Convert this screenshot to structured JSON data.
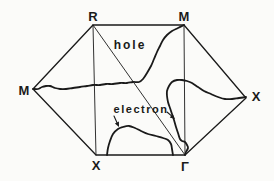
{
  "figure": {
    "background_color": "#fbfbf9",
    "ink_color": "#1a1a1a"
  },
  "zone": {
    "boundary_points": [
      [
        33,
        89
      ],
      [
        93,
        25
      ],
      [
        184,
        25
      ],
      [
        246,
        98
      ],
      [
        185,
        155
      ],
      [
        96,
        155
      ]
    ],
    "internal_lines": [
      {
        "name": "line-R-X",
        "from": [
          93,
          25
        ],
        "to": [
          96,
          155
        ]
      },
      {
        "name": "line-M-Gamma",
        "from": [
          184,
          25
        ],
        "to": [
          185,
          155
        ]
      },
      {
        "name": "line-R-Gamma",
        "from": [
          93,
          25
        ],
        "to": [
          185,
          155
        ]
      }
    ]
  },
  "point_labels": [
    {
      "id": "label-R-top",
      "text": "R",
      "x": 93,
      "y": 21
    },
    {
      "id": "label-M-top-right",
      "text": "M",
      "x": 184,
      "y": 21
    },
    {
      "id": "label-M-left",
      "text": "M",
      "x": 24,
      "y": 95
    },
    {
      "id": "label-X-right",
      "text": "X",
      "x": 256,
      "y": 101
    },
    {
      "id": "label-X-bottom",
      "text": "X",
      "x": 96,
      "y": 170
    },
    {
      "id": "label-Gamma-bottom",
      "text": "Γ",
      "x": 185,
      "y": 171
    }
  ],
  "region_labels": [
    {
      "id": "label-hole",
      "text": "hole",
      "x": 130,
      "y": 49,
      "font_size": 12,
      "letter_spacing": 2
    },
    {
      "id": "label-electron",
      "text": "electron",
      "x": 141,
      "y": 113,
      "font_size": 11,
      "letter_spacing": 1.5
    }
  ],
  "fermi_curves": [
    {
      "name": "hole-surface-curve",
      "points": [
        [
          184,
          25
        ],
        [
          178,
          28
        ],
        [
          172,
          31
        ],
        [
          167,
          35
        ],
        [
          163,
          40
        ],
        [
          160,
          46
        ],
        [
          157,
          52
        ],
        [
          154,
          59
        ],
        [
          151,
          66
        ],
        [
          147,
          73
        ],
        [
          143,
          79
        ],
        [
          139,
          82
        ],
        [
          133,
          82
        ],
        [
          127,
          83
        ],
        [
          120,
          83
        ],
        [
          113,
          84
        ],
        [
          106,
          84
        ],
        [
          100,
          85
        ],
        [
          93,
          85
        ],
        [
          87,
          86
        ],
        [
          80,
          87
        ],
        [
          73,
          88
        ],
        [
          66,
          89
        ],
        [
          60,
          89
        ],
        [
          55,
          88
        ],
        [
          50,
          86
        ],
        [
          46,
          86
        ],
        [
          42,
          87
        ],
        [
          38,
          89
        ],
        [
          35,
          89
        ],
        [
          33,
          89
        ]
      ]
    },
    {
      "name": "electron-pocket-X-curve",
      "points": [
        [
          246,
          97
        ],
        [
          239,
          98
        ],
        [
          232,
          99
        ],
        [
          225,
          99
        ],
        [
          218,
          97
        ],
        [
          211,
          94
        ],
        [
          204,
          91
        ],
        [
          198,
          87
        ],
        [
          192,
          83
        ],
        [
          187,
          81
        ],
        [
          182,
          80
        ],
        [
          177,
          80
        ],
        [
          172,
          82
        ],
        [
          169,
          86
        ],
        [
          167,
          91
        ],
        [
          167,
          96
        ],
        [
          168,
          102
        ],
        [
          170,
          108
        ],
        [
          172,
          114
        ],
        [
          174,
          120
        ],
        [
          176,
          127
        ],
        [
          178,
          133
        ],
        [
          180,
          139
        ],
        [
          182,
          141
        ],
        [
          185,
          142
        ],
        [
          187,
          145
        ],
        [
          188,
          148
        ],
        [
          186,
          152
        ],
        [
          185,
          155
        ]
      ]
    },
    {
      "name": "electron-dome-curve",
      "points": [
        [
          107,
          155
        ],
        [
          108,
          148
        ],
        [
          110,
          141
        ],
        [
          113,
          134
        ],
        [
          118,
          129
        ],
        [
          123,
          127
        ],
        [
          129,
          126
        ],
        [
          135,
          128
        ],
        [
          141,
          131
        ],
        [
          148,
          134
        ],
        [
          156,
          136
        ],
        [
          163,
          138
        ],
        [
          168,
          140
        ],
        [
          171,
          144
        ],
        [
          172,
          149
        ],
        [
          173,
          155
        ]
      ]
    }
  ],
  "arrows": [
    {
      "name": "electron-arrow-left",
      "from": [
        114,
        116
      ],
      "to": [
        119,
        127
      ]
    },
    {
      "name": "electron-arrow-right",
      "from": [
        167,
        112
      ],
      "to": [
        175,
        119
      ]
    }
  ]
}
